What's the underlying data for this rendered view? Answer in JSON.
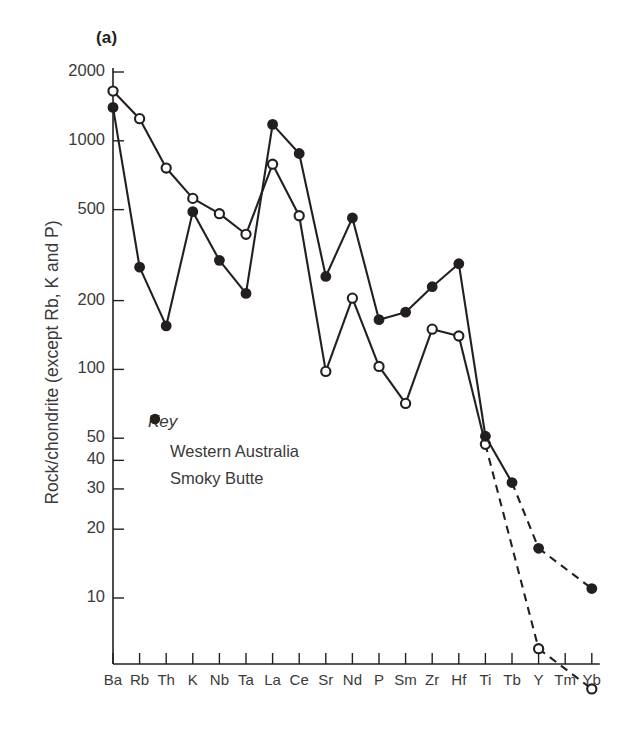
{
  "panel": {
    "label": "(a)"
  },
  "axes": {
    "ylabel": "Rock/chondrite (except Rb, K and P)",
    "yticks": [
      2000,
      1000,
      500,
      200,
      100,
      50,
      40,
      30,
      20,
      10
    ],
    "ytick_labels": [
      "2000",
      "1000",
      "500",
      "200",
      "100",
      "50",
      "40",
      "30",
      "20",
      "10"
    ],
    "xtick_labels": [
      "Ba",
      "Rb",
      "Th",
      "K",
      "Nb",
      "Ta",
      "La",
      "Ce",
      "Sr",
      "Nd",
      "P",
      "Sm",
      "Zr",
      "Hf",
      "Ti",
      "Tb",
      "Y",
      "Tm",
      "Yb"
    ]
  },
  "legend": {
    "title": "Key",
    "entries": [
      {
        "label": "Western Australia",
        "marker": "open-circle"
      },
      {
        "label": "Smoky Butte",
        "marker": "filled-circle"
      }
    ]
  },
  "colors": {
    "line": "#231f20",
    "text": "#3a3a3a",
    "background": "#ffffff"
  },
  "chart_data": {
    "type": "line",
    "title": "",
    "xlabel": "",
    "ylabel": "Rock/chondrite (except Rb, K and P)",
    "yscale": "log",
    "ylim": [
      3,
      2400
    ],
    "grid": false,
    "legend_position": "inside-left",
    "categories": [
      "Ba",
      "Rb",
      "Th",
      "K",
      "Nb",
      "Ta",
      "La",
      "Ce",
      "Sr",
      "Nd",
      "P",
      "Sm",
      "Zr",
      "Hf",
      "Ti",
      "Tb",
      "Y",
      "Tm",
      "Yb"
    ],
    "series": [
      {
        "name": "Western Australia",
        "marker": "open-circle",
        "values": [
          1650,
          1250,
          760,
          560,
          480,
          390,
          790,
          470,
          98,
          205,
          103,
          71,
          150,
          140,
          47,
          null,
          6.0,
          null,
          4.0
        ],
        "dashed_from": "Ti"
      },
      {
        "name": "Smoky Butte",
        "marker": "filled-circle",
        "values": [
          1400,
          280,
          155,
          490,
          300,
          215,
          1180,
          880,
          255,
          460,
          165,
          178,
          230,
          290,
          51,
          32,
          16.5,
          null,
          11.0
        ],
        "dashed_from": "Tb"
      }
    ]
  }
}
